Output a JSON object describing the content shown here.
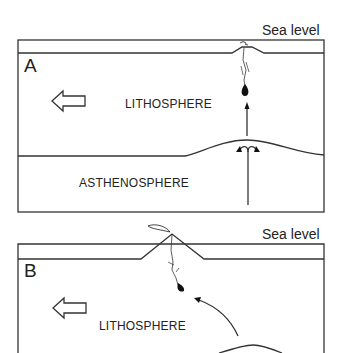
{
  "panels": [
    {
      "id": "A",
      "label": "A",
      "sea_level_label": "Sea level",
      "layers": {
        "lithosphere": "LITHOSPHERE",
        "asthenosphere": "ASTHENOSPHERE"
      }
    },
    {
      "id": "B",
      "label": "B",
      "sea_level_label": "Sea level",
      "layers": {
        "lithosphere": "LITHOSPHERE"
      }
    }
  ],
  "colors": {
    "line": "#333333",
    "background": "#ffffff",
    "text": "#222222"
  }
}
